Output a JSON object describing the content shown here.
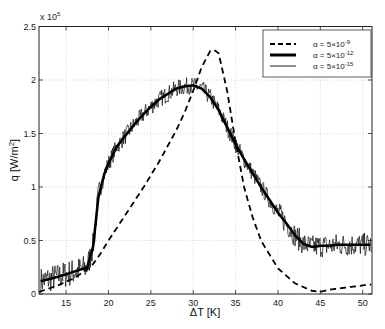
{
  "chart_data": {
    "type": "line",
    "title": "",
    "xlabel": "ΔT [K]",
    "ylabel": "q [W/m²]",
    "y_multiplier": "x 10^5",
    "xlim": [
      11.8,
      51.1
    ],
    "ylim": [
      0,
      2.5
    ],
    "xticks": [
      15,
      20,
      25,
      30,
      35,
      40,
      45,
      50
    ],
    "yticks": [
      0,
      0.5,
      1,
      1.5,
      2,
      2.5
    ],
    "ytick_labels": [
      "0",
      "0.5",
      "1",
      "1.5",
      "2",
      "2.5"
    ],
    "grid": true,
    "legend_position": "upper right",
    "series": [
      {
        "name": "α = 5×10⁻⁹",
        "style": "dashed",
        "x": [
          11.8,
          14,
          16,
          18,
          19,
          20,
          22,
          24,
          26,
          28,
          29,
          30,
          31,
          32,
          32.5,
          33,
          34,
          35,
          36,
          37,
          38,
          40,
          42,
          44,
          45,
          46,
          48,
          50,
          51.1
        ],
        "y": [
          0.02,
          0.08,
          0.15,
          0.26,
          0.37,
          0.5,
          0.74,
          0.98,
          1.24,
          1.53,
          1.7,
          1.9,
          2.12,
          2.27,
          2.28,
          2.25,
          1.9,
          1.42,
          1.0,
          0.72,
          0.5,
          0.24,
          0.1,
          0.03,
          0.02,
          0.04,
          0.06,
          0.08,
          0.09
        ]
      },
      {
        "name": "α = 5×10⁻¹²",
        "style": "thick-solid",
        "x": [
          12,
          14,
          16,
          17.5,
          18.2,
          18.8,
          19.5,
          20,
          21,
          22,
          23,
          24,
          25,
          26,
          27,
          28,
          29,
          30,
          31,
          32,
          33,
          34,
          35,
          36,
          37,
          38,
          39,
          40,
          41,
          42,
          43,
          44,
          45,
          46,
          47,
          48,
          49,
          50,
          51
        ],
        "y": [
          0.12,
          0.16,
          0.21,
          0.25,
          0.45,
          0.9,
          1.12,
          1.22,
          1.38,
          1.48,
          1.58,
          1.67,
          1.75,
          1.82,
          1.87,
          1.92,
          1.94,
          1.95,
          1.92,
          1.84,
          1.72,
          1.56,
          1.4,
          1.26,
          1.13,
          1.0,
          0.88,
          0.76,
          0.66,
          0.55,
          0.47,
          0.44,
          0.45,
          0.45,
          0.46,
          0.46,
          0.46,
          0.46,
          0.46
        ]
      },
      {
        "name": "α = 5×10⁻¹⁵",
        "style": "thin-solid-noisy",
        "noise_amplitude": 0.1,
        "follows": "α = 5×10⁻¹²"
      }
    ]
  },
  "legend": {
    "items": [
      {
        "label_base": "α = 5×10",
        "exp": "-9",
        "style": "dashed"
      },
      {
        "label_base": "α = 5×10",
        "exp": "-12",
        "style": "thick"
      },
      {
        "label_base": "α = 5×10",
        "exp": "-15",
        "style": "thin"
      }
    ]
  },
  "axes": {
    "x_label": "ΔT [K]",
    "y_label_base": "q [W/m",
    "y_label_sup": "2",
    "y_label_end": "]",
    "multiplier_base": "x 10",
    "multiplier_exp": "5"
  }
}
